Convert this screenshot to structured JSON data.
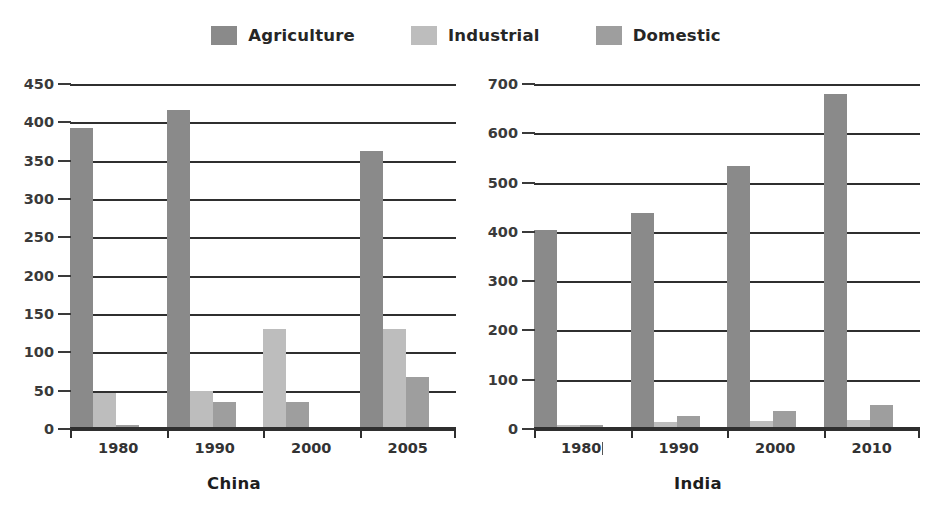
{
  "legend": {
    "items": [
      {
        "label": "Agriculture",
        "color": "#8a8a8a",
        "icon": "legend-swatch-icon"
      },
      {
        "label": "Industrial",
        "color": "#bdbdbd",
        "icon": "legend-swatch-icon"
      },
      {
        "label": "Domestic",
        "color": "#9e9e9e",
        "icon": "legend-swatch-icon"
      }
    ]
  },
  "panels": [
    {
      "id": "china",
      "title": "China",
      "yticks": [
        "450",
        "400",
        "350",
        "300",
        "250",
        "200",
        "150",
        "100",
        "50",
        "0"
      ],
      "xticks": [
        "1980",
        "1990",
        "2000",
        "2005"
      ]
    },
    {
      "id": "india",
      "title": "India",
      "yticks": [
        "700",
        "600",
        "500",
        "400",
        "300",
        "200",
        "100",
        "0"
      ],
      "xticks": [
        "1980",
        "1990",
        "2000",
        "2010"
      ]
    }
  ],
  "chart_data": [
    {
      "type": "bar",
      "title": "China",
      "xlabel": "",
      "ylabel": "",
      "categories": [
        "1980",
        "1990",
        "2000",
        "2005"
      ],
      "series": [
        {
          "name": "Agriculture",
          "color": "#8a8a8a",
          "values": [
            390,
            413,
            0,
            360
          ]
        },
        {
          "name": "Industrial",
          "color": "#bdbdbd",
          "values": [
            45,
            47,
            128,
            128
          ]
        },
        {
          "name": "Domestic",
          "color": "#9e9e9e",
          "values": [
            3,
            33,
            32,
            65
          ]
        }
      ],
      "ylim": [
        0,
        450
      ],
      "ytick_step": 50,
      "grid": true,
      "legend_position": "top-center"
    },
    {
      "type": "bar",
      "title": "India",
      "xlabel": "",
      "ylabel": "",
      "categories": [
        "1980",
        "1990",
        "2000",
        "2010"
      ],
      "series": [
        {
          "name": "Agriculture",
          "color": "#8a8a8a",
          "values": [
            400,
            435,
            530,
            675
          ]
        },
        {
          "name": "Industrial",
          "color": "#bdbdbd",
          "values": [
            5,
            10,
            12,
            15
          ]
        },
        {
          "name": "Domestic",
          "color": "#9e9e9e",
          "values": [
            5,
            22,
            33,
            44
          ]
        }
      ],
      "ylim": [
        0,
        700
      ],
      "ytick_step": 100,
      "grid": true,
      "legend_position": "top-center"
    }
  ]
}
